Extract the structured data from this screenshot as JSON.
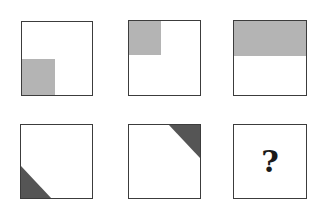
{
  "puzzle": {
    "colors": {
      "light_fill": "#b4b4b4",
      "dark_fill": "#555555",
      "border": "#3c3c3c"
    },
    "row1": [
      {
        "id": "r1c1",
        "shading": "light gray square, bottom-left quarter"
      },
      {
        "id": "r1c2",
        "shading": "light gray square, top-left quarter"
      },
      {
        "id": "r1c3",
        "shading": "light gray rectangle, top half"
      }
    ],
    "row2": [
      {
        "id": "r2c1",
        "shading": "dark gray triangle, bottom-left corner"
      },
      {
        "id": "r2c2",
        "shading": "dark gray triangle, top-right corner"
      },
      {
        "id": "r2c3",
        "shading": "unknown",
        "label": "?"
      }
    ]
  }
}
